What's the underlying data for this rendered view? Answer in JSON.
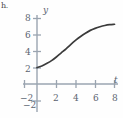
{
  "figure": {
    "label_fragment": "h.",
    "axis_color": "#9aa4b0",
    "curve_color": "#3b3b3b",
    "text_color": "#5b6470"
  },
  "chart_data": {
    "type": "line",
    "title": "",
    "subtitle": "",
    "xlabel": "t",
    "ylabel": "y",
    "xlim": [
      -2.6,
      9.2
    ],
    "ylim": [
      -2.6,
      8.8
    ],
    "xticks": [
      -2,
      2,
      4,
      6,
      8
    ],
    "xtick_labels": [
      "−2",
      "2",
      "4",
      "6",
      "8"
    ],
    "yticks": [
      2,
      4,
      6,
      8,
      -2
    ],
    "ytick_labels": [
      "2",
      "4",
      "6",
      "8",
      "−2"
    ],
    "grid": false,
    "legend": "none",
    "series": [
      {
        "name": "solution curve",
        "x": [
          0,
          0.5,
          1,
          1.5,
          2,
          2.5,
          3,
          3.5,
          4,
          4.5,
          5,
          5.5,
          6,
          6.5,
          7,
          7.5,
          8
        ],
        "y": [
          2.0,
          2.2,
          2.5,
          2.85,
          3.3,
          3.8,
          4.3,
          4.85,
          5.35,
          5.8,
          6.2,
          6.55,
          6.8,
          7.0,
          7.15,
          7.25,
          7.3
        ]
      }
    ],
    "annotations": []
  }
}
